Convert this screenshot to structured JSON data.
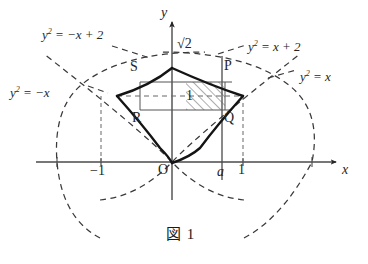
{
  "figure": {
    "caption": "図 1",
    "caption_number": "1",
    "caption_symbol": "図",
    "axes": {
      "x_axis_label": "x",
      "y_axis_label": "y",
      "origin_label": "O"
    },
    "tick_labels": [
      {
        "name": "x-neg-one",
        "text": "−1",
        "axis": "x",
        "value": -1
      },
      {
        "name": "x-a",
        "text": "a",
        "axis": "x",
        "value": 0.7
      },
      {
        "name": "x-one",
        "text": "1",
        "axis": "x",
        "value": 1
      },
      {
        "name": "y-sqrt2",
        "text": "√2",
        "axis": "y",
        "value": 1.414
      }
    ],
    "curve_labels": [
      {
        "name": "curve-label-neg-x-plus-2",
        "text": "y² = −x + 2"
      },
      {
        "name": "curve-label-x-plus-2",
        "text": "y² = x + 2"
      },
      {
        "name": "curve-label-neg-x",
        "text": "y² = −x"
      },
      {
        "name": "curve-label-x",
        "text": "y² = x"
      }
    ],
    "point_labels": [
      {
        "name": "point-label-s",
        "text": "S"
      },
      {
        "name": "point-label-p",
        "text": "P"
      },
      {
        "name": "point-label-r",
        "text": "R"
      },
      {
        "name": "point-label-q",
        "text": "Q"
      }
    ],
    "inner_label": {
      "name": "inner-region-label",
      "text": "1"
    },
    "colors": {
      "ink": "#262626",
      "solid_curve": "#141414",
      "dashed_curve": "#3a3a3a",
      "thin_line": "#555555",
      "hatch": "#6a6a6a",
      "background": "#ffffff"
    }
  },
  "chart_data": {
    "type": "line",
    "title": "図 1",
    "xlabel": "x",
    "ylabel": "y",
    "xlim": [
      -2.2,
      2.6
    ],
    "ylim": [
      -1.2,
      2.0
    ],
    "grid": false,
    "legend": "inline-curve-labels",
    "series": [
      {
        "name": "y² = x",
        "style": "dashed",
        "equation": "y^2 = x",
        "vertex": [
          0,
          0
        ],
        "opens": "right"
      },
      {
        "name": "y² = −x",
        "style": "dashed",
        "equation": "y^2 = -x",
        "vertex": [
          0,
          0
        ],
        "opens": "left"
      },
      {
        "name": "y² = x + 2",
        "style": "dashed",
        "equation": "y^2 = x + 2",
        "vertex": [
          -2,
          0
        ],
        "opens": "right"
      },
      {
        "name": "y² = −x + 2",
        "style": "dashed",
        "equation": "y^2 = -x + 2",
        "vertex": [
          2,
          0
        ],
        "opens": "left"
      },
      {
        "name": "boundary-upper-right",
        "style": "solid",
        "equation": "y^2 = -x + 2",
        "from": [
          0,
          1.414
        ],
        "to": [
          1,
          1
        ]
      },
      {
        "name": "boundary-upper-left",
        "style": "solid",
        "equation": "y^2 = x + 2",
        "from": [
          -1,
          1
        ],
        "to": [
          0,
          1.414
        ]
      },
      {
        "name": "boundary-lower-right",
        "style": "solid",
        "equation": "y^2 = x",
        "from": [
          0,
          0
        ],
        "to": [
          1,
          1
        ]
      },
      {
        "name": "boundary-lower-left",
        "style": "solid",
        "equation": "y^2 = -x",
        "from": [
          -1,
          1
        ],
        "to": [
          0,
          0
        ]
      }
    ],
    "points": [
      {
        "label": "P",
        "x": 1,
        "y": 1
      },
      {
        "label": "S",
        "x": -1,
        "y": 1
      },
      {
        "label": "R",
        "x": -1,
        "y": 1
      },
      {
        "label": "Q",
        "x": 1,
        "y": 1
      },
      {
        "label": "O",
        "x": 0,
        "y": 0
      }
    ],
    "annotations": [
      {
        "text": "√2",
        "x": 0,
        "y": 1.414,
        "note": "y-intercept of upper boundary"
      },
      {
        "text": "a",
        "x": 0.7,
        "y": 0,
        "note": "vertical line x = a"
      },
      {
        "text": "1",
        "x": 0.45,
        "y": 1.0,
        "note": "label inside shaded strip"
      }
    ],
    "shaded_region": {
      "type": "hatched-rectangle",
      "x_from": 0.2,
      "x_to": 0.75,
      "y_from": 0.82,
      "y_to": 1.22,
      "hatch_angle_deg": 45
    }
  }
}
